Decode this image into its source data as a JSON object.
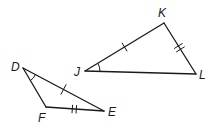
{
  "diagram": {
    "type": "congruent-triangles",
    "triangles": [
      {
        "name": "triangle-DFE",
        "vertices": [
          {
            "label": "D",
            "x": 23,
            "y": 68
          },
          {
            "label": "F",
            "x": 46,
            "y": 107
          },
          {
            "label": "E",
            "x": 104,
            "y": 111
          }
        ]
      },
      {
        "name": "triangle-JKL",
        "vertices": [
          {
            "label": "J",
            "x": 85,
            "y": 71
          },
          {
            "label": "K",
            "x": 164,
            "y": 23
          },
          {
            "label": "L",
            "x": 196,
            "y": 74
          }
        ]
      }
    ],
    "labels": {
      "D": "D",
      "F": "F",
      "E": "E",
      "J": "J",
      "K": "K",
      "L": "L"
    },
    "markings": {
      "single_tick": [
        "DE",
        "JK"
      ],
      "double_tick": [
        "FE",
        "KL"
      ],
      "angle_arc": [
        "D",
        "J"
      ]
    },
    "colors": {
      "stroke": "#1a1a1a",
      "background": "#ffffff"
    }
  }
}
